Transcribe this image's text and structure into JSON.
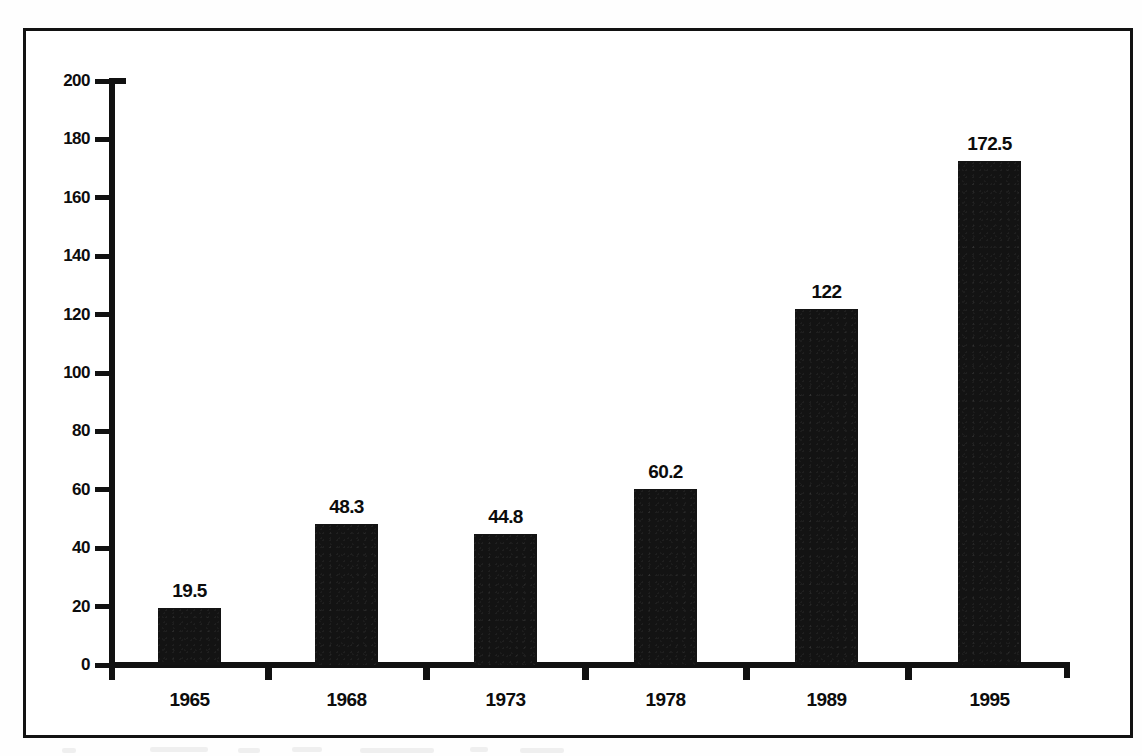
{
  "chart_data": {
    "type": "bar",
    "title": "",
    "subtitle": "",
    "xlabel": "",
    "ylabel": "",
    "categories": [
      "1965",
      "1968",
      "1973",
      "1978",
      "1989",
      "1995"
    ],
    "values": [
      19.5,
      48.3,
      44.8,
      60.2,
      122,
      172.5
    ],
    "value_labels": [
      "19.5",
      "48.3",
      "44.8",
      "60.2",
      "122",
      "172.5"
    ],
    "ylim": [
      0,
      200
    ],
    "ytick_labels": [
      "0",
      "20",
      "40",
      "60",
      "80",
      "100",
      "120",
      "140",
      "160",
      "180",
      "200"
    ],
    "ytick_values": [
      0,
      20,
      40,
      60,
      80,
      100,
      120,
      140,
      160,
      180,
      200
    ],
    "grid": false,
    "legend": null,
    "legend_position": "none",
    "bar_color": "#131313",
    "axis_color": "#111111",
    "background_color": "#ffffff",
    "value_labels_shown": true,
    "tick_placement": "between-bars"
  },
  "figure": {
    "border_color": "#121212",
    "page_background": "#ffffff"
  }
}
